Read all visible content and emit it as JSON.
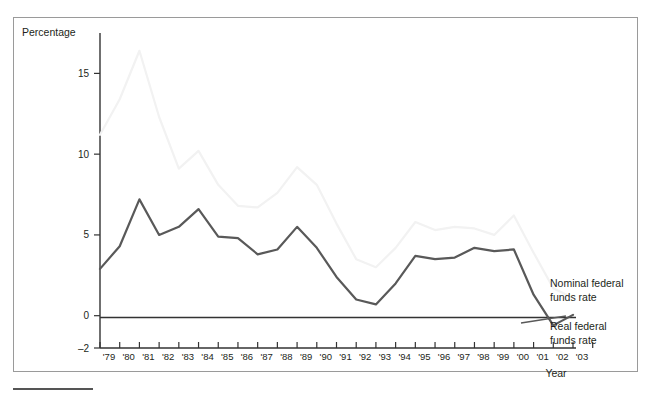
{
  "figure": {
    "y_axis_title": "Percentage",
    "x_axis_title": "Year"
  },
  "legend": {
    "nominal_line1": "Nominal federal",
    "nominal_line2": "funds rate",
    "real_line1": "Real federal",
    "real_line2": "funds rate"
  },
  "colors": {
    "nominal": "#f2f2f2",
    "real": "#595959",
    "axis": "#333333",
    "frame": "#9a9a9a",
    "background": "#ffffff"
  },
  "chart_data": {
    "type": "line",
    "title": "",
    "xlabel": "Year",
    "ylabel": "Percentage",
    "ylim": [
      -2,
      17.5
    ],
    "yticks": [
      15,
      10,
      5,
      0,
      -2
    ],
    "ytick_labels": [
      "15",
      "10",
      "5",
      "0",
      "–2"
    ],
    "grid": false,
    "legend_position": "right-inline",
    "categories": [
      "'79",
      "'80",
      "'81",
      "'82",
      "'83",
      "'84",
      "'85",
      "'86",
      "'87",
      "'88",
      "'89",
      "'90",
      "'91",
      "'92",
      "'93",
      "'94",
      "'95",
      "'96",
      "'97",
      "'98",
      "'99",
      "'00",
      "'01",
      "'02",
      "'03"
    ],
    "series": [
      {
        "name": "Nominal federal funds rate",
        "color": "#f2f2f2",
        "values": [
          11.2,
          13.4,
          16.4,
          12.3,
          9.1,
          10.2,
          8.1,
          6.8,
          6.7,
          7.6,
          9.2,
          8.1,
          5.7,
          3.5,
          3.0,
          4.2,
          5.8,
          5.3,
          5.5,
          5.4,
          5.0,
          6.2,
          3.9,
          1.7,
          1.1
        ]
      },
      {
        "name": "Real federal funds rate",
        "color": "#595959",
        "values": [
          2.9,
          4.3,
          7.2,
          5.0,
          5.5,
          6.6,
          4.9,
          4.8,
          3.8,
          4.1,
          5.5,
          4.2,
          2.4,
          1.0,
          0.7,
          2.0,
          3.7,
          3.5,
          3.6,
          4.2,
          4.0,
          4.1,
          1.3,
          -0.6,
          0.05
        ]
      }
    ]
  }
}
